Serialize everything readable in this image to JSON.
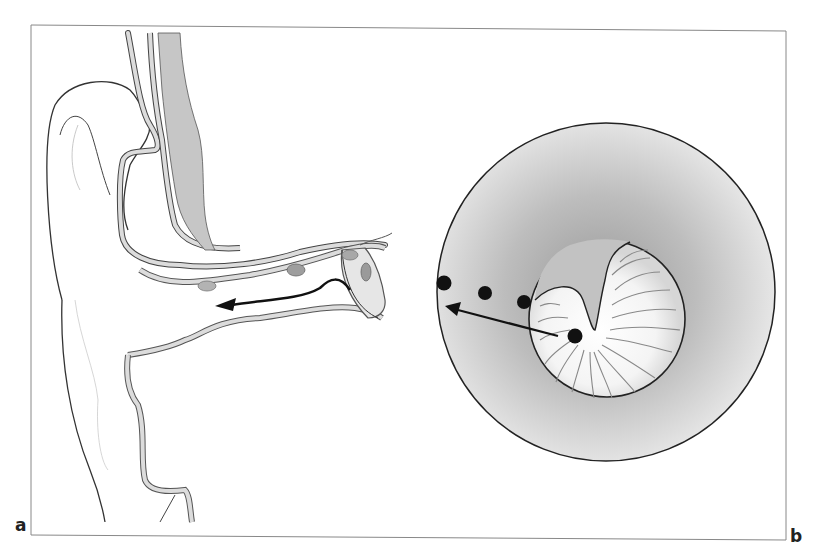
{
  "figure": {
    "type": "medical-illustration",
    "frame_color": "#777777",
    "background": "#ffffff"
  },
  "panels": [
    {
      "label": "a",
      "description": "Sagittal section of the external ear canal with arrow indicating outward epithelial migration",
      "colors": {
        "outline": "#333333",
        "tissue_fill": "#dcdcdc",
        "dark_fill": "#c4c4c4",
        "arrow": "#111111"
      }
    },
    {
      "label": "b",
      "description": "Otoscopic view of the tympanic membrane with dots marking migration path from the umbo outward",
      "colors": {
        "outer_gradient_dark": "#a8a8a8",
        "outer_gradient_light": "#e4e4e4",
        "membrane": "#fafafa",
        "dot": "#111111",
        "fibers": "#888888"
      },
      "dots": [
        {
          "x": 444,
          "y": 283,
          "r": 7.5
        },
        {
          "x": 485,
          "y": 293,
          "r": 7
        },
        {
          "x": 524,
          "y": 302,
          "r": 7
        },
        {
          "x": 575,
          "y": 336,
          "r": 7.5
        }
      ]
    }
  ]
}
